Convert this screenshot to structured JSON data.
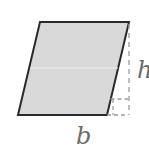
{
  "figure": {
    "shape": "parallelogram",
    "fill_color": "#d9d9d9",
    "stroke_color": "#2a2a2a",
    "guide_color": "#9a9a9a",
    "vertices": {
      "top_left": [
        40,
        22
      ],
      "top_right": [
        129,
        22
      ],
      "bottom_right": [
        107,
        115
      ],
      "bottom_left": [
        18,
        115
      ]
    },
    "height_line": {
      "x": 129,
      "y1": 22,
      "y2": 115,
      "style": "dashed"
    },
    "right_angle_marker": {
      "x": 113,
      "y": 99,
      "size": 16
    },
    "labels": {
      "base": "b",
      "height": "h"
    }
  }
}
